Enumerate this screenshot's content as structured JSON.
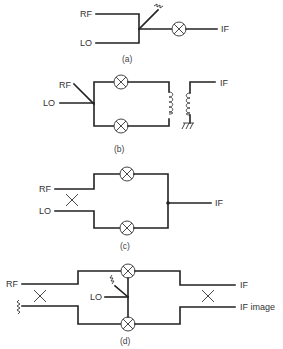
{
  "diagrams": {
    "a": {
      "caption": "(a)",
      "labels": {
        "rf": "RF",
        "lo": "LO",
        "if": "IF"
      }
    },
    "b": {
      "caption": "(b)",
      "labels": {
        "rf": "RF",
        "lo": "LO",
        "if": "IF"
      }
    },
    "c": {
      "caption": "(c)",
      "labels": {
        "rf": "RF",
        "lo": "LO",
        "if": "IF"
      }
    },
    "d": {
      "caption": "(d)",
      "labels": {
        "rf": "RF",
        "lo": "LO",
        "if": "IF",
        "if_image": "IF image"
      }
    }
  },
  "icons": {
    "mixer": "circle-with-x",
    "hybrid": "x-cross",
    "termination": "resistor-zigzag",
    "transformer": "coil",
    "ground": "ground-hatch"
  }
}
